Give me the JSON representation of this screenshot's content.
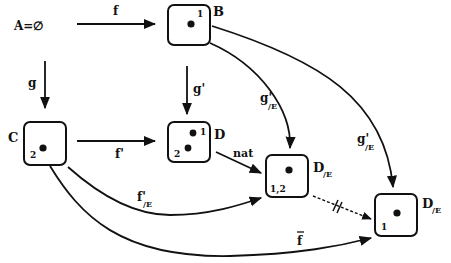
{
  "diagram": {
    "type": "commutative-diagram",
    "nodes": [
      {
        "id": "A",
        "label": "A=∅",
        "x": 48,
        "y": 24
      },
      {
        "id": "B",
        "label": "B",
        "points": [
          {
            "mark": "1"
          }
        ],
        "x": 168,
        "y": 8
      },
      {
        "id": "C",
        "label": "C",
        "points": [
          {
            "mark": "2"
          }
        ],
        "x": 25,
        "y": 121
      },
      {
        "id": "D",
        "label": "D",
        "points": [
          {
            "mark": "1"
          },
          {
            "mark": "2"
          }
        ],
        "x": 168,
        "y": 121
      },
      {
        "id": "DE1",
        "label": "D",
        "sub": "/E",
        "points": [
          {
            "mark": "1,2"
          }
        ],
        "x": 266,
        "y": 155
      },
      {
        "id": "DE2",
        "label": "D",
        "sub": "/E",
        "points": [
          {
            "mark": "1"
          }
        ],
        "x": 376,
        "y": 194
      }
    ],
    "edges": [
      {
        "from": "A",
        "to": "B",
        "label": "f"
      },
      {
        "from": "A",
        "to": "C",
        "label": "g"
      },
      {
        "from": "B",
        "to": "D",
        "label": "g'"
      },
      {
        "from": "C",
        "to": "D",
        "label": "f'"
      },
      {
        "from": "B",
        "to": "DE1",
        "label": "g'",
        "sub": "/E"
      },
      {
        "from": "B",
        "to": "DE2",
        "label": "g'",
        "sub": "/E"
      },
      {
        "from": "D",
        "to": "DE1",
        "label": "nat"
      },
      {
        "from": "C",
        "to": "DE1",
        "label": "f'",
        "sub": "/E"
      },
      {
        "from": "C",
        "to": "DE2",
        "label": "f̄"
      },
      {
        "from": "DE1",
        "to": "DE2",
        "label": "",
        "style": "dashed-crossed"
      }
    ]
  },
  "labels": {
    "A": "A=∅",
    "B": "B",
    "C": "C",
    "D": "D",
    "DE": "D",
    "sub_E": "/E",
    "f": "f",
    "g": "g",
    "g_prime": "g'",
    "f_prime": "f'",
    "nat": "nat",
    "f_bar": "f",
    "mark_1": "1",
    "mark_2": "2",
    "mark_12": "1,2"
  }
}
